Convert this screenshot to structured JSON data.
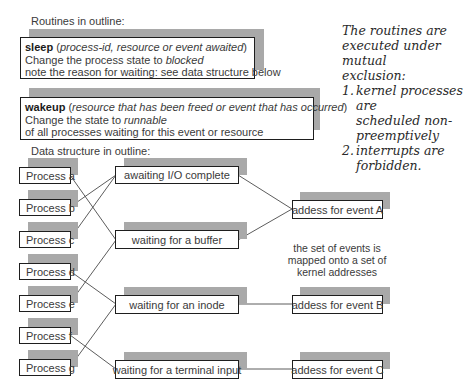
{
  "routines_heading": "Routines in outline:",
  "routines": {
    "sleep": {
      "name": "sleep",
      "args_open": " (",
      "args": "process-id, resource or event awaited",
      "args_close": ")",
      "line2_prefix": "Change the process state to ",
      "line2_state": "blocked",
      "line3": "note the reason for waiting: see data structure below"
    },
    "wakeup": {
      "name": "wakeup",
      "args_open": " (",
      "args": "resource that has been freed or event that has occurred",
      "args_close": ")",
      "line2_prefix": "Change the state to ",
      "line2_state": "runnable",
      "line3": "of all processes waiting for this event or resource"
    }
  },
  "note": {
    "intro": [
      "The routines are",
      "executed under mutual",
      "exclusion:"
    ],
    "items": [
      {
        "num": "1.",
        "lines": [
          "kernel processes are",
          "scheduled non-",
          "preemptively"
        ]
      },
      {
        "num": "2.",
        "lines": [
          "interrupts are",
          "forbidden."
        ]
      }
    ]
  },
  "data_structure_heading": "Data structure in outline:",
  "processes": [
    {
      "id": "a",
      "label": "Process a",
      "waits_on": "buffer"
    },
    {
      "id": "b",
      "label": "Process b",
      "waits_on": "io"
    },
    {
      "id": "c",
      "label": "Process c",
      "waits_on": "io"
    },
    {
      "id": "d",
      "label": "Process d",
      "waits_on": "inode"
    },
    {
      "id": "e",
      "label": "Process e",
      "waits_on": "buffer"
    },
    {
      "id": "f",
      "label": "Process f",
      "waits_on": "terminal"
    },
    {
      "id": "g",
      "label": "Process g",
      "waits_on": "inode"
    }
  ],
  "wait_reasons": [
    {
      "id": "io",
      "label": "awaiting I/O complete",
      "event": "A"
    },
    {
      "id": "buffer",
      "label": "waiting for a buffer",
      "event": "A"
    },
    {
      "id": "inode",
      "label": "waiting for an inode",
      "event": "B"
    },
    {
      "id": "terminal",
      "label": "waiting for a terminal input",
      "event": "C"
    }
  ],
  "event_addresses": [
    {
      "id": "A",
      "label": "addess for event A"
    },
    {
      "id": "B",
      "label": "addess for event B"
    },
    {
      "id": "C",
      "label": "addess for event C"
    }
  ],
  "mapping_caption": [
    "the set of events is",
    "mapped onto a set of",
    "kernel addresses"
  ],
  "colors": {
    "shadow": "#a9a9a9",
    "border": "#1e1e1e",
    "text": "#3a3a3a",
    "line": "#4a4a4a"
  }
}
